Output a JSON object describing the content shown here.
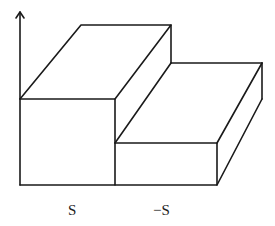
{
  "diagram": {
    "type": "step-function 3D block sketch",
    "stroke_color": "#1a1a1a",
    "background": "#ffffff",
    "axis": {
      "kind": "vertical arrow",
      "x": 20,
      "y_top": 12,
      "y_bottom": 185
    },
    "blocks": [
      {
        "name": "tall-block",
        "front": {
          "x1": 20,
          "y_top": 99,
          "x2": 115,
          "y_bottom": 185
        },
        "back_top": {
          "x1": 81,
          "x2": 171,
          "y": 25
        }
      },
      {
        "name": "short-block",
        "front": {
          "x1": 115,
          "y_top": 143,
          "x2": 217,
          "y_bottom": 185
        },
        "back_top": {
          "x1": 171,
          "x2": 262,
          "y": 63
        },
        "back_right_bottom_y": 99
      }
    ],
    "labels": [
      {
        "text": "S",
        "x": 68,
        "y": 203
      },
      {
        "text": "−S",
        "x": 153,
        "y": 203
      }
    ]
  }
}
